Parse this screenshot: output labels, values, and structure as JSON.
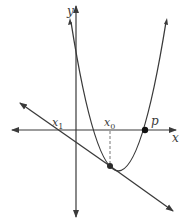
{
  "diagram": {
    "title": "",
    "colors": {
      "stroke": "#3a3a3a",
      "background": "#ffffff"
    },
    "axes": {
      "x_label": "x",
      "y_label": "y"
    },
    "labels": {
      "x1_main": "x",
      "x1_sub": "1",
      "x0_main": "x",
      "x0_sub": "0",
      "p": "p"
    },
    "elements": [
      {
        "type": "curve",
        "name": "parabola",
        "note": "upward-opening parabola crossing x-axis at p"
      },
      {
        "type": "line",
        "name": "tangent-line",
        "note": "tangent at (x0, f(x0)) crossing x-axis at x1"
      },
      {
        "type": "point",
        "name": "tangent-point",
        "at": "x0"
      },
      {
        "type": "point",
        "name": "root-point",
        "at": "p"
      },
      {
        "type": "dashed-line",
        "name": "x0-guide",
        "note": "vertical from x-axis at x0 to tangent point"
      }
    ]
  }
}
